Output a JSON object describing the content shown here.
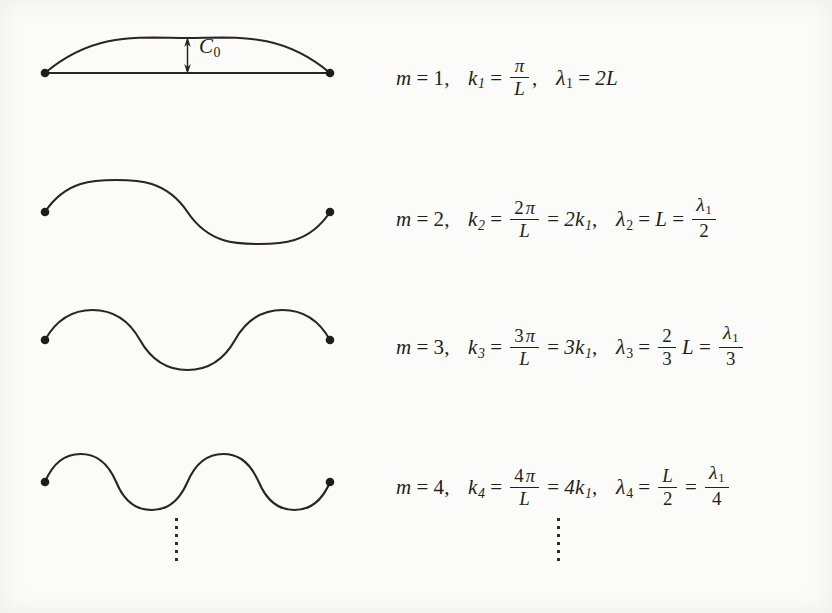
{
  "figure": {
    "annotation": {
      "amplitude_label": "C",
      "amplitude_sub": "0"
    },
    "ellipsis_dot_count": 6,
    "colors": {
      "curve": "#2a2520",
      "text": "#241f1a",
      "background": "#fbfbf9",
      "endpoint": "#201c18"
    }
  },
  "modes": [
    {
      "m_symbol": "m",
      "m_value": "1",
      "k_symbol": "k",
      "k_sub": "1",
      "k_num": "π",
      "k_num_coeff": "",
      "k_den": "L",
      "k_alt": "",
      "lambda_symbol": "λ",
      "lambda_sub": "1",
      "lambda_value": "2L",
      "lambda_frac_num": "",
      "lambda_frac_den": "",
      "half_periods": 1,
      "amplitude_px": 35,
      "baseline_y": 73
    },
    {
      "m_symbol": "m",
      "m_value": "2",
      "k_symbol": "k",
      "k_sub": "2",
      "k_num": "π",
      "k_num_coeff": "2",
      "k_den": "L",
      "k_alt": "2k",
      "k_alt_sub": "1",
      "lambda_symbol": "λ",
      "lambda_sub": "2",
      "lambda_value": "L",
      "lambda_frac_num": "λ",
      "lambda_frac_num_sub": "1",
      "lambda_frac_den": "2",
      "half_periods": 2,
      "amplitude_px": 32,
      "baseline_y": 212
    },
    {
      "m_symbol": "m",
      "m_value": "3",
      "k_symbol": "k",
      "k_sub": "3",
      "k_num": "π",
      "k_num_coeff": "3",
      "k_den": "L",
      "k_alt": "3k",
      "k_alt_sub": "1",
      "lambda_symbol": "λ",
      "lambda_sub": "3",
      "lambda_pre_num": "2",
      "lambda_pre_den": "3",
      "lambda_pre_tail": "L",
      "lambda_frac_num": "λ",
      "lambda_frac_num_sub": "1",
      "lambda_frac_den": "3",
      "half_periods": 3,
      "amplitude_px": 30,
      "baseline_y": 340
    },
    {
      "m_symbol": "m",
      "m_value": "4",
      "k_symbol": "k",
      "k_sub": "4",
      "k_num": "π",
      "k_num_coeff": "4",
      "k_den": "L",
      "k_alt": "4k",
      "k_alt_sub": "1",
      "lambda_symbol": "λ",
      "lambda_sub": "4",
      "lambda_pre_num": "L",
      "lambda_pre_den": "2",
      "lambda_frac_num": "λ",
      "lambda_frac_num_sub": "1",
      "lambda_frac_den": "4",
      "half_periods": 4,
      "amplitude_px": 28,
      "baseline_y": 482
    }
  ],
  "symbols": {
    "equals": "=",
    "comma": ",",
    "pi": "π",
    "lambda": "λ",
    "L": "L"
  },
  "chart_data": {
    "type": "line",
    "xlabel": "",
    "ylabel": "",
    "x_range": [
      0,
      1
    ],
    "series": [
      {
        "name": "m = 1",
        "half_periods": 1,
        "wavenumber": "pi/L",
        "wavelength": "2L",
        "amplitude": 35
      },
      {
        "name": "m = 2",
        "half_periods": 2,
        "wavenumber": "2pi/L",
        "wavelength": "L",
        "amplitude": 32
      },
      {
        "name": "m = 3",
        "half_periods": 3,
        "wavenumber": "3pi/L",
        "wavelength": "2L/3",
        "amplitude": 30
      },
      {
        "name": "m = 4",
        "half_periods": 4,
        "wavenumber": "4pi/L",
        "wavelength": "L/2",
        "amplitude": 28
      }
    ],
    "string_left_x": 45,
    "string_right_x": 330,
    "grid": false,
    "legend": "none"
  }
}
